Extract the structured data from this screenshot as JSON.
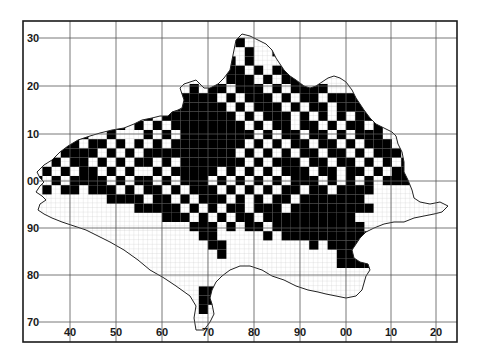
{
  "map": {
    "type": "tetrad distribution map",
    "frame": {
      "left": 23,
      "top": 21,
      "right": 457,
      "bottom": 342
    },
    "colors": {
      "background": "#ffffff",
      "frame": "#1a1a1a",
      "grid": "#555555",
      "fine_grid": "#b8b8b8",
      "occupied": "#000000",
      "coast": "#222222"
    },
    "x_ticks": [
      {
        "label": "40",
        "x": 70
      },
      {
        "label": "50",
        "x": 116
      },
      {
        "label": "60",
        "x": 162
      },
      {
        "label": "70",
        "x": 208
      },
      {
        "label": "80",
        "x": 254
      },
      {
        "label": "90",
        "x": 300
      },
      {
        "label": "00",
        "x": 346
      },
      {
        "label": "10",
        "x": 391
      },
      {
        "label": "20",
        "x": 436
      }
    ],
    "y_ticks": [
      {
        "label": "30",
        "y": 38
      },
      {
        "label": "20",
        "y": 86
      },
      {
        "label": "10",
        "y": 134
      },
      {
        "label": "00",
        "y": 181
      },
      {
        "label": "90",
        "y": 228
      },
      {
        "label": "80",
        "y": 275
      },
      {
        "label": "70",
        "y": 322
      }
    ],
    "tetrad_px": 9.2,
    "grid_origin": {
      "x": 24,
      "y": 38
    },
    "coastline": "M37,172 L44,165 L52,160 L60,152 L68,146 L78,140 L90,136 L100,133 L112,130 L124,128 L134,124 L142,120 L152,118 L160,116 L168,116 L172,112 L178,110 L182,108 L184,100 L182,94 L180,88 L184,84 L190,82 L196,80 L200,84 L204,88 L210,88 L218,84 L224,78 L230,70 L232,60 L234,50 L236,40 L242,34 L250,36 L258,40 L266,44 L272,50 L276,58 L280,64 L284,70 L290,76 L296,80 L304,86 L310,88 L316,86 L322,82 L328,78 L334,76 L340,78 L346,82 L352,90 L356,98 L360,104 L364,110 L370,118 L376,124 L384,128 L392,132 L396,136 L398,144 L402,152 L404,162 L404,172 L408,180 L412,190 L414,198 L420,202 L430,204 L440,202 L448,206 L442,212 L434,214 L424,216 L414,218 L404,222 L394,222 L384,224 L374,228 L366,232 L360,238 L356,244 L352,250 L354,258 L360,262 L368,264 L370,270 L366,276 L362,290 L356,296 L346,298 L336,296 L326,294 L318,292 L308,290 L296,286 L284,280 L272,276 L262,270 L250,266 L240,266 L230,270 L222,276 L216,282 L212,290 L210,298 L212,304 L214,314 L210,322 L204,330 L196,330 L194,318 L196,306 L190,296 L176,286 L164,278 L150,270 L138,260 L124,250 L110,242 L98,236 L86,230 L74,226 L62,222 L52,218 L44,214 L38,210 L40,204 L46,200 L42,196 L36,192 L40,186 L44,182 L40,178 Z",
    "occupied_rows": [
      {
        "row": 0,
        "cells": [
          23
        ]
      },
      {
        "row": 1,
        "cells": [
          24,
          27
        ]
      },
      {
        "row": 2,
        "cells": [
          22,
          24,
          28,
          29
        ]
      },
      {
        "row": 3,
        "cells": [
          22,
          23,
          25,
          27,
          28,
          29,
          30
        ]
      },
      {
        "row": 4,
        "cells": [
          13,
          15,
          20,
          22,
          23,
          24,
          26,
          28,
          29,
          30,
          31
        ]
      },
      {
        "row": 5,
        "cells": [
          13,
          15,
          18,
          20,
          21,
          23,
          24,
          25,
          27,
          29,
          30,
          31,
          32
        ]
      },
      {
        "row": 6,
        "cells": [
          12,
          14,
          17,
          18,
          19,
          20,
          22,
          24,
          25,
          26,
          28,
          30,
          31,
          33,
          34,
          35,
          36
        ]
      },
      {
        "row": 7,
        "cells": [
          11,
          13,
          16,
          17,
          18,
          19,
          20,
          21,
          23,
          25,
          26,
          27,
          29,
          31,
          32,
          34,
          35,
          36,
          37
        ]
      },
      {
        "row": 8,
        "cells": [
          8,
          10,
          13,
          15,
          16,
          17,
          18,
          19,
          20,
          21,
          22,
          24,
          26,
          27,
          28,
          30,
          32,
          34,
          36,
          37
        ]
      },
      {
        "row": 9,
        "cells": [
          6,
          10,
          12,
          14,
          16,
          17,
          18,
          19,
          20,
          21,
          22,
          23,
          25,
          27,
          28,
          30,
          31,
          33,
          35,
          36,
          38
        ]
      },
      {
        "row": 10,
        "cells": [
          2,
          4,
          6,
          9,
          13,
          15,
          17,
          18,
          19,
          20,
          21,
          22,
          23,
          24,
          26,
          28,
          29,
          31,
          32,
          34,
          36,
          37,
          38
        ]
      },
      {
        "row": 11,
        "cells": [
          1,
          2,
          3,
          4,
          5,
          7,
          8,
          10,
          12,
          14,
          16,
          17,
          18,
          19,
          20,
          21,
          22,
          23,
          25,
          27,
          29,
          30,
          32,
          33,
          35,
          37,
          38,
          39
        ]
      },
      {
        "row": 12,
        "cells": [
          2,
          4,
          5,
          6,
          7,
          9,
          11,
          13,
          14,
          15,
          16,
          17,
          18,
          19,
          20,
          21,
          22,
          24,
          26,
          28,
          30,
          31,
          33,
          34,
          36,
          38,
          39,
          40
        ]
      },
      {
        "row": 13,
        "cells": [
          1,
          3,
          5,
          6,
          8,
          10,
          12,
          13,
          15,
          17,
          18,
          19,
          20,
          21,
          22,
          23,
          25,
          27,
          28,
          29,
          31,
          32,
          34,
          35,
          37,
          39,
          41,
          42,
          43
        ]
      },
      {
        "row": 14,
        "cells": [
          2,
          4,
          6,
          7,
          9,
          11,
          14,
          16,
          17,
          18,
          19,
          20,
          22,
          24,
          26,
          28,
          29,
          30,
          32,
          33,
          35,
          36,
          38,
          40,
          41,
          42,
          44,
          45,
          46
        ]
      },
      {
        "row": 15,
        "cells": [
          1,
          3,
          5,
          6,
          7,
          8,
          10,
          12,
          13,
          15,
          17,
          18,
          19,
          21,
          23,
          25,
          27,
          29,
          30,
          31,
          33,
          35,
          37,
          39,
          40,
          41
        ]
      },
      {
        "row": 16,
        "cells": [
          2,
          4,
          5,
          7,
          8,
          9,
          11,
          13,
          14,
          16,
          18,
          19,
          20,
          22,
          24,
          26,
          28,
          29,
          31,
          32,
          34,
          35,
          36,
          37
        ]
      },
      {
        "row": 17,
        "cells": [
          9,
          10,
          11,
          12,
          14,
          15,
          17,
          19,
          20,
          21,
          23,
          25,
          27,
          28,
          30,
          31,
          32,
          33,
          34,
          35,
          36
        ]
      },
      {
        "row": 18,
        "cells": [
          12,
          13,
          14,
          15,
          16,
          18,
          20,
          22,
          23,
          25,
          26,
          27,
          29,
          30,
          31,
          32,
          33,
          34,
          35,
          36,
          37
        ]
      },
      {
        "row": 19,
        "cells": [
          15,
          16,
          17,
          19,
          21,
          23,
          24,
          26,
          27,
          28,
          29,
          30,
          31,
          32,
          33,
          34,
          35
        ]
      },
      {
        "row": 20,
        "cells": [
          18,
          19,
          20,
          22,
          24,
          25,
          27,
          28,
          29,
          30,
          31,
          32,
          33,
          34,
          35,
          36
        ]
      },
      {
        "row": 21,
        "cells": [
          19,
          20,
          26,
          28,
          29,
          30,
          31,
          32,
          33,
          34,
          35,
          36,
          37
        ]
      },
      {
        "row": 22,
        "cells": [
          20,
          21,
          31,
          33,
          34,
          35,
          36,
          37
        ]
      },
      {
        "row": 23,
        "cells": [
          21,
          34,
          35,
          36,
          37
        ]
      },
      {
        "row": 24,
        "cells": [
          34,
          35,
          36,
          37
        ]
      },
      {
        "row": 27,
        "cells": [
          19,
          20
        ]
      },
      {
        "row": 28,
        "cells": [
          19,
          20
        ]
      },
      {
        "row": 29,
        "cells": [
          19
        ]
      }
    ]
  }
}
